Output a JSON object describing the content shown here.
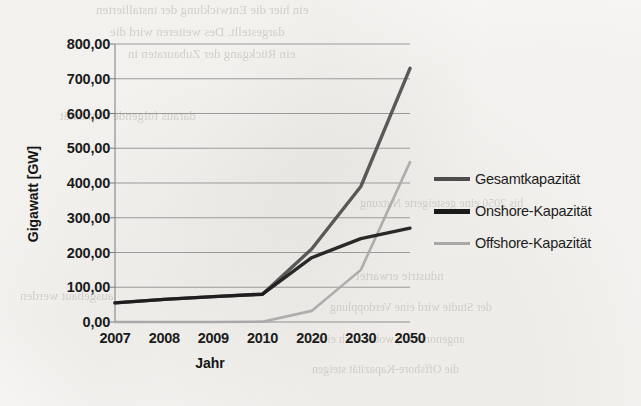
{
  "chart_data": {
    "type": "line",
    "title": "",
    "xlabel": "Jahr",
    "ylabel": "Gigawatt [GW]",
    "categories": [
      "2007",
      "2008",
      "2009",
      "2010",
      "2020",
      "2030",
      "2050"
    ],
    "ylim": [
      0,
      800
    ],
    "ytick_step": 100,
    "ytick_labels": [
      "800,00",
      "700,00",
      "600,00",
      "500,00",
      "400,00",
      "300,00",
      "200,00",
      "100,00",
      "0,00"
    ],
    "ytick_values": [
      800,
      700,
      600,
      500,
      400,
      300,
      200,
      100,
      0
    ],
    "grid": true,
    "grid_axis": "y",
    "legend_position": "right",
    "series": [
      {
        "name": "Gesamtkapazität",
        "color": "#4d4d4d",
        "width": 3.4,
        "values": [
          55,
          65,
          73,
          80,
          210,
          390,
          730
        ]
      },
      {
        "name": "Onshore-Kapazität",
        "color": "#1a1a1a",
        "width": 3.4,
        "values": [
          55,
          65,
          73,
          80,
          185,
          240,
          270
        ]
      },
      {
        "name": "Offshore-Kapazität",
        "color": "#a8a8a8",
        "width": 2.6,
        "values": [
          0,
          0,
          0,
          1,
          32,
          150,
          460
        ]
      }
    ]
  },
  "legend": {
    "items": [
      {
        "label": "Gesamtkapazität",
        "color": "#4d4d4d",
        "thickness": "4px"
      },
      {
        "label": "Onshore-Kapazität",
        "color": "#1a1a1a",
        "thickness": "5px"
      },
      {
        "label": "Offshore-Kapazität",
        "color": "#a8a8a8",
        "thickness": "3px"
      }
    ]
  },
  "scan_artifacts": {
    "bleed_lines": [
      {
        "text": "ein hier die Entwicklung der installierten",
        "x": 96,
        "y": 2,
        "size": 13
      },
      {
        "text": "dargestellt. Des weiteren wird die",
        "x": 110,
        "y": 24,
        "size": 13
      },
      {
        "text": "ein Rückgang der Zubauraten in",
        "x": 128,
        "y": 46,
        "size": 13
      },
      {
        "text": "daraus folgende Kapazität",
        "x": 60,
        "y": 108,
        "size": 13
      },
      {
        "text": "bis 2050 eine gesteigerte Nutzung",
        "x": 360,
        "y": 196,
        "size": 12
      },
      {
        "text": "ndustrie erwartet",
        "x": 356,
        "y": 268,
        "size": 13
      },
      {
        "text": "ausgebaut werden",
        "x": 20,
        "y": 288,
        "size": 13
      },
      {
        "text": "der Studie wird eine Verdopplung",
        "x": 330,
        "y": 300,
        "size": 12
      },
      {
        "text": "angenommen, wobei auch eine",
        "x": 316,
        "y": 332,
        "size": 12
      },
      {
        "text": "die Offshore-Kapazität steigen",
        "x": 312,
        "y": 362,
        "size": 12
      }
    ]
  }
}
